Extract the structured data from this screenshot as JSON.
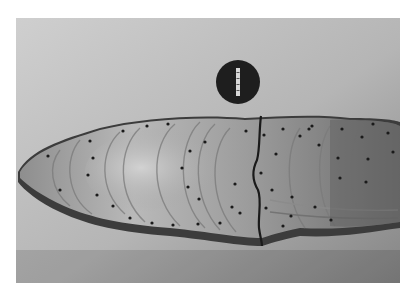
{
  "image": {
    "description": "Grayscale photograph of a polished layered specimen cross-section with concentric growth bands, dot markers along bands, a vertical crack, and a dark circular label disc above",
    "subject": "layered-specimen-section",
    "colors": {
      "page_background": "#ffffff",
      "backdrop_light": "#c9c9c9",
      "backdrop_dark": "#8a8a8a",
      "specimen_light": "#c4c4c4",
      "specimen_mid": "#9a9a9a",
      "specimen_dark": "#5a5a5a",
      "rim_dark": "#3c3c3c",
      "label_disc": "#1e1e1e",
      "marker_dot": "#1a1a1a"
    },
    "label_disc": {
      "cx": 238,
      "cy": 82,
      "r": 22
    },
    "crack": {
      "x_approx": 262
    },
    "marker_count_approx": 48
  }
}
